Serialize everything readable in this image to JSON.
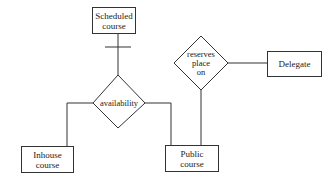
{
  "diagram": {
    "type": "entity-relationship",
    "entities": [
      {
        "id": "scheduled",
        "label_line1": "Scheduled",
        "label_line2": "course"
      },
      {
        "id": "delegate",
        "label": "Delegate"
      },
      {
        "id": "inhouse",
        "label_line1": "Inhouse",
        "label_line2": "course"
      },
      {
        "id": "public",
        "label_line1": "Public",
        "label_line2": "course"
      }
    ],
    "relationships": [
      {
        "id": "availability",
        "label": "availability"
      },
      {
        "id": "reserves",
        "label_line1": "reserves",
        "label_line2": "place",
        "label_line3": "on"
      }
    ],
    "connections": [
      {
        "from": "scheduled",
        "to": "availability",
        "marker": "one (crossbar)"
      },
      {
        "from": "availability",
        "to": "inhouse"
      },
      {
        "from": "availability",
        "to": "public"
      },
      {
        "from": "reserves",
        "to": "delegate"
      },
      {
        "from": "reserves",
        "to": "public"
      }
    ],
    "line_color": "#333333"
  }
}
